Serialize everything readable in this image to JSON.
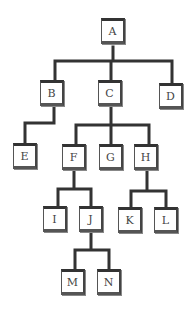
{
  "diagram": {
    "type": "tree",
    "nodes": [
      {
        "id": "A",
        "label": "A",
        "x": 101,
        "y": 18
      },
      {
        "id": "B",
        "label": "B",
        "x": 40,
        "y": 80
      },
      {
        "id": "C",
        "label": "C",
        "x": 98,
        "y": 80
      },
      {
        "id": "D",
        "label": "D",
        "x": 159,
        "y": 83
      },
      {
        "id": "E",
        "label": "E",
        "x": 13,
        "y": 143
      },
      {
        "id": "F",
        "label": "F",
        "x": 62,
        "y": 144
      },
      {
        "id": "G",
        "label": "G",
        "x": 99,
        "y": 144
      },
      {
        "id": "H",
        "label": "H",
        "x": 134,
        "y": 144
      },
      {
        "id": "I",
        "label": "I",
        "x": 43,
        "y": 206
      },
      {
        "id": "J",
        "label": "J",
        "x": 79,
        "y": 206
      },
      {
        "id": "K",
        "label": "K",
        "x": 118,
        "y": 207
      },
      {
        "id": "L",
        "label": "L",
        "x": 154,
        "y": 207
      },
      {
        "id": "M",
        "label": "M",
        "x": 61,
        "y": 269
      },
      {
        "id": "N",
        "label": "N",
        "x": 97,
        "y": 269
      }
    ],
    "edges": [
      [
        "A",
        "B"
      ],
      [
        "A",
        "C"
      ],
      [
        "A",
        "D"
      ],
      [
        "B",
        "E"
      ],
      [
        "C",
        "F"
      ],
      [
        "C",
        "G"
      ],
      [
        "C",
        "H"
      ],
      [
        "F",
        "I"
      ],
      [
        "F",
        "J"
      ],
      [
        "H",
        "K"
      ],
      [
        "H",
        "L"
      ],
      [
        "J",
        "M"
      ],
      [
        "J",
        "N"
      ]
    ]
  }
}
